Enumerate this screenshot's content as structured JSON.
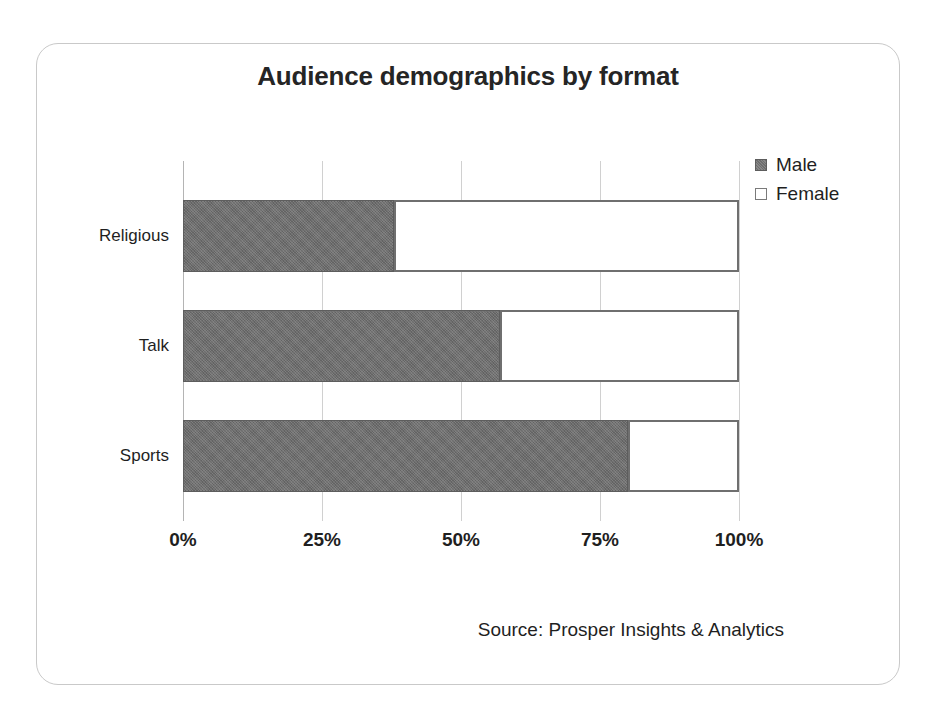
{
  "chart_data": {
    "type": "bar",
    "orientation": "horizontal",
    "stacked": true,
    "normalized": true,
    "title": "Audience demographics by format",
    "xlabel": "",
    "ylabel": "",
    "xlim": [
      0,
      100
    ],
    "xticks": [
      "0%",
      "25%",
      "50%",
      "75%",
      "100%"
    ],
    "xtick_values": [
      0,
      25,
      50,
      75,
      100
    ],
    "grid": true,
    "grid_axis": "x",
    "legend_position": "top-right",
    "categories": [
      "Religious",
      "Talk",
      "Sports"
    ],
    "series": [
      {
        "name": "Male",
        "color": "#6e6e6e",
        "values": [
          38,
          57,
          80
        ]
      },
      {
        "name": "Female",
        "color": "#ffffff",
        "values": [
          62,
          43,
          20
        ]
      }
    ],
    "source": "Source: Prosper Insights & Analytics"
  },
  "legend": {
    "items": [
      {
        "label": "Male",
        "swatch": "filled-gray-square"
      },
      {
        "label": "Female",
        "swatch": "outlined-white-square"
      }
    ]
  }
}
